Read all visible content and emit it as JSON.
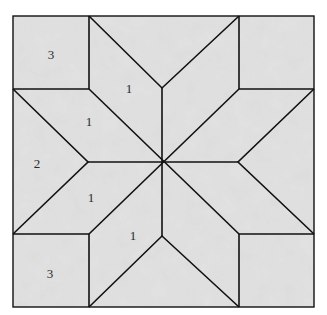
{
  "diagram": {
    "colors": {
      "background": "#ffffff",
      "fabric": "#dcdcdc",
      "fabric_dark": "#cfcfcf",
      "line": "#111111"
    },
    "outer_square": {
      "x": 13,
      "y": 16,
      "w": 301,
      "h": 291
    },
    "center": {
      "x": 163,
      "y": 162
    },
    "labels": [
      {
        "id": "corner-top-left",
        "text": "3",
        "x": 51,
        "y": 59
      },
      {
        "id": "diamond-top-left-upper",
        "text": "1",
        "x": 129,
        "y": 93
      },
      {
        "id": "diamond-top-left-lower",
        "text": "1",
        "x": 89,
        "y": 126
      },
      {
        "id": "side-left",
        "text": "2",
        "x": 37,
        "y": 168
      },
      {
        "id": "diamond-bottom-left-upper",
        "text": "1",
        "x": 91,
        "y": 202
      },
      {
        "id": "diamond-bottom-left-lower",
        "text": "1",
        "x": 133,
        "y": 240
      },
      {
        "id": "corner-bottom-left",
        "text": "3",
        "x": 50,
        "y": 278
      }
    ],
    "legend": {
      "1": "diamond",
      "2": "side triangle",
      "3": "corner square"
    }
  }
}
